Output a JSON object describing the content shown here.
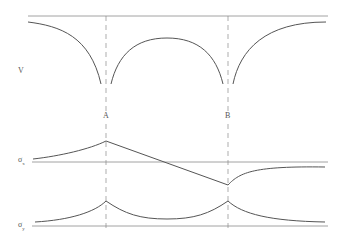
{
  "diagram": {
    "labels": {
      "v": "V",
      "a": "A",
      "b": "B",
      "sigma_x": "σ",
      "sigma_x_sub": "x",
      "sigma_y": "σ",
      "sigma_y_sub": "y"
    },
    "colors": {
      "stroke": "#555555",
      "thin": "#8a8a8a"
    }
  }
}
